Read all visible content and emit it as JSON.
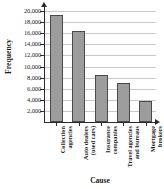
{
  "chart_data": {
    "type": "bar",
    "title": "",
    "xlabel": "Cause",
    "ylabel": "Frequency",
    "categories": [
      "Collection agencies",
      "Auto dealers (used cars)",
      "Insurance companies",
      "Travel agencies and bureaus",
      "Mortgage brokers"
    ],
    "category_lines": [
      [
        "Collection",
        "agencies"
      ],
      [
        "Auto dealers",
        "(used cars)"
      ],
      [
        "Insurance",
        "companies"
      ],
      [
        "Travel agencies",
        "and bureaus"
      ],
      [
        "Mortgage",
        "brokers"
      ]
    ],
    "values": [
      19200,
      16400,
      8400,
      7000,
      3700
    ],
    "ylim": [
      0,
      20000
    ],
    "ytick_values": [
      2000,
      4000,
      6000,
      8000,
      10000,
      12000,
      14000,
      16000,
      18000,
      20000
    ],
    "ytick_labels": [
      "2,000",
      "4,000",
      "6,000",
      "8,000",
      "10,000",
      "12,000",
      "14,000",
      "16,000",
      "18,000",
      "20,000"
    ],
    "grid": true,
    "legend": false,
    "bar_color": "#9d9d9d",
    "bar_border_color": "#4a4a4a",
    "gridline_color": "#c9c9c9",
    "axis_color": "#2b2b2b"
  }
}
